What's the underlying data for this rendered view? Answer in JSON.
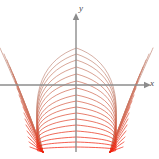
{
  "figure": {
    "width": 159,
    "height": 159,
    "background": "#ffffff",
    "corner_note": ""
  },
  "axes": {
    "color": "#8c8c8c",
    "stroke_width": 1.4,
    "x_axis": {
      "label": "x",
      "label_color": "#4a4a4a",
      "y_pixel": 85,
      "x_start": 0,
      "x_end": 146,
      "arrow": "right"
    },
    "y_axis": {
      "label": "y",
      "label_color": "#4a4a4a",
      "x_pixel": 76,
      "y_start": 152,
      "y_end": 18,
      "arrow": "up"
    }
  },
  "chart_data": {
    "type": "line",
    "title": "",
    "xlabel": "x",
    "ylabel": "y",
    "grid": false,
    "legend": null,
    "singular_points_px": [
      {
        "x": 43,
        "y": 152
      },
      {
        "x": 110,
        "y": 152
      }
    ],
    "origin_px": {
      "x": 76,
      "y": 85
    },
    "n_curves": 17,
    "color_outer": "#c98a77",
    "color_inner": "#f03008",
    "colors": [
      "#c49081",
      "#c68a78",
      "#c88471",
      "#ca7e6a",
      "#cc7863",
      "#ce715c",
      "#d16a54",
      "#d3634c",
      "#d65c44",
      "#d9543c",
      "#dd4b33",
      "#e1422a",
      "#e53921",
      "#e93018",
      "#ed2610",
      "#f01f0b",
      "#f31806"
    ],
    "series": [
      {
        "name": "curve-1",
        "peak_px": {
          "x": 76,
          "y": 48
        },
        "left_x_px": 12,
        "right_x_px": 141,
        "color": "#c49081"
      },
      {
        "name": "curve-2",
        "peak_px": {
          "x": 76,
          "y": 54
        },
        "left_x_px": 16,
        "right_x_px": 137,
        "color": "#c68a78"
      },
      {
        "name": "curve-3",
        "peak_px": {
          "x": 76,
          "y": 60
        },
        "left_x_px": 19,
        "right_x_px": 134,
        "color": "#c88471"
      },
      {
        "name": "curve-4",
        "peak_px": {
          "x": 76,
          "y": 67
        },
        "left_x_px": 22,
        "right_x_px": 131,
        "color": "#ca7e6a"
      },
      {
        "name": "curve-5",
        "peak_px": {
          "x": 76,
          "y": 74
        },
        "left_x_px": 25,
        "right_x_px": 128,
        "color": "#cc7863"
      },
      {
        "name": "curve-6",
        "peak_px": {
          "x": 76,
          "y": 81
        },
        "left_x_px": 27,
        "right_x_px": 126,
        "color": "#ce715c"
      },
      {
        "name": "curve-7",
        "peak_px": {
          "x": 76,
          "y": 88
        },
        "left_x_px": 29,
        "right_x_px": 124,
        "color": "#d16a54"
      },
      {
        "name": "curve-8",
        "peak_px": {
          "x": 76,
          "y": 95
        },
        "left_x_px": 31,
        "right_x_px": 122,
        "color": "#d3634c"
      },
      {
        "name": "curve-9",
        "peak_px": {
          "x": 76,
          "y": 101
        },
        "left_x_px": 33,
        "right_x_px": 120,
        "color": "#d65c44"
      },
      {
        "name": "curve-10",
        "peak_px": {
          "x": 76,
          "y": 107
        },
        "left_x_px": 35,
        "right_x_px": 118,
        "color": "#d9543c"
      },
      {
        "name": "curve-11",
        "peak_px": {
          "x": 76,
          "y": 113
        },
        "left_x_px": 36,
        "right_x_px": 117,
        "color": "#dd4b33"
      },
      {
        "name": "curve-12",
        "peak_px": {
          "x": 76,
          "y": 119
        },
        "left_x_px": 37,
        "right_x_px": 116,
        "color": "#e1422a"
      },
      {
        "name": "curve-13",
        "peak_px": {
          "x": 76,
          "y": 125
        },
        "left_x_px": 38,
        "right_x_px": 115,
        "color": "#e53921"
      },
      {
        "name": "curve-14",
        "peak_px": {
          "x": 76,
          "y": 131
        },
        "left_x_px": 39,
        "right_x_px": 114,
        "color": "#e93018"
      },
      {
        "name": "curve-15",
        "peak_px": {
          "x": 76,
          "y": 137
        },
        "left_x_px": 40,
        "right_x_px": 113,
        "color": "#ed2610"
      },
      {
        "name": "curve-16",
        "peak_px": {
          "x": 76,
          "y": 142
        },
        "left_x_px": 41,
        "right_x_px": 112,
        "color": "#f01f0b"
      },
      {
        "name": "curve-17",
        "peak_px": {
          "x": 76,
          "y": 147
        },
        "left_x_px": 42,
        "right_x_px": 111,
        "color": "#f31806"
      }
    ]
  }
}
